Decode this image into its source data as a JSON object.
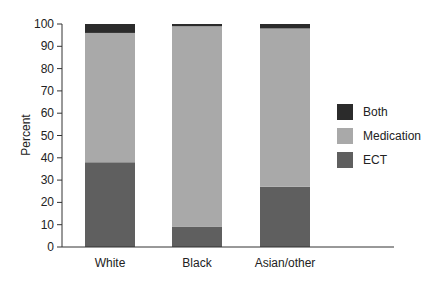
{
  "chart_data": {
    "type": "bar",
    "stacked": true,
    "title": "",
    "xlabel": "",
    "ylabel": "Percent",
    "ylim": [
      0,
      100
    ],
    "yticks": [
      0,
      10,
      20,
      30,
      40,
      50,
      60,
      70,
      80,
      90,
      100
    ],
    "categories": [
      "White",
      "Black",
      "Asian/other"
    ],
    "series": [
      {
        "name": "ECT",
        "color": "#5f5f5f",
        "values": [
          38,
          9,
          27
        ]
      },
      {
        "name": "Medication",
        "color": "#a9a9a9",
        "values": [
          58,
          90,
          71
        ]
      },
      {
        "name": "Both",
        "color": "#2b2b2b",
        "values": [
          4,
          1,
          2
        ]
      }
    ],
    "legend": {
      "position": "right",
      "entries": [
        "Both",
        "Medication",
        "ECT"
      ]
    },
    "grid": false
  },
  "legend": {
    "items": [
      {
        "label": "Both",
        "color": "#2b2b2b"
      },
      {
        "label": "Medication",
        "color": "#a9a9a9"
      },
      {
        "label": "ECT",
        "color": "#5f5f5f"
      }
    ]
  }
}
